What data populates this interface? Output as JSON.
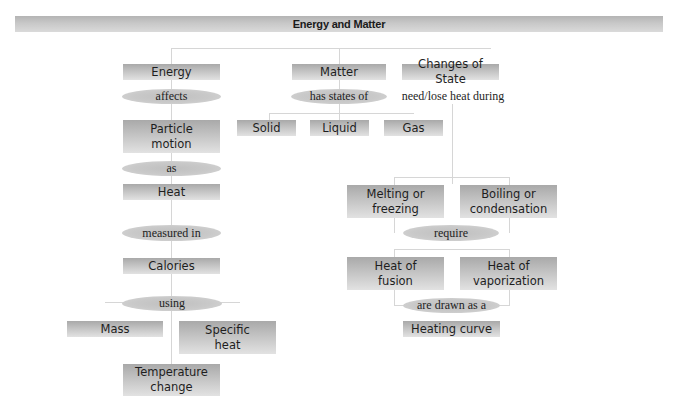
{
  "title": "Energy and Matter",
  "nodes": {
    "energy": "Energy",
    "matter": "Matter",
    "changes_of_state": "Changes of State",
    "particle_motion": "Particle\nmotion",
    "solid": "Solid",
    "liquid": "Liquid",
    "gas": "Gas",
    "heat": "Heat",
    "calories": "Calories",
    "mass": "Mass",
    "specific_heat": "Specific\nheat",
    "temperature_change": "Temperature\nchange",
    "melting_or_freezing": "Melting or\nfreezing",
    "boiling_or_condensation": "Boiling or\ncondensation",
    "heat_of_fusion": "Heat of\nfusion",
    "heat_of_vaporization": "Heat of\nvaporization",
    "heating_curve": "Heating curve"
  },
  "links": {
    "affects": "affects",
    "has_states_of": "has states of",
    "need_lose_heat_during": "need/lose heat during",
    "as": "as",
    "measured_in": "measured in",
    "using": "using",
    "require": "require",
    "are_drawn_as_a": "are drawn as a"
  },
  "colors": {
    "node_fill_top": "#a9a9a9",
    "node_fill_bottom": "#e2e2e2",
    "link_fill": "#c6c6c6",
    "connector": "#d6d6d6",
    "text": "#1e1e1e"
  }
}
